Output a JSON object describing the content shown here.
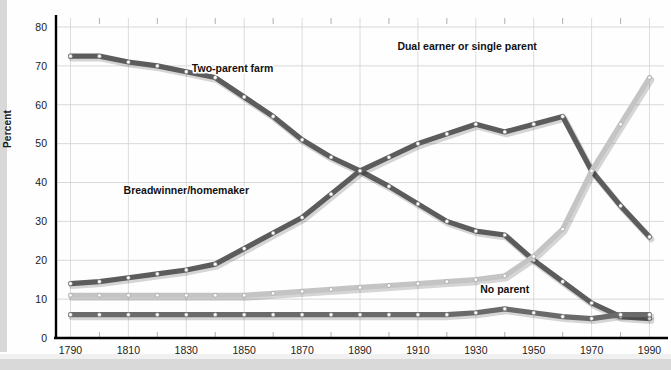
{
  "chart_data": {
    "type": "line",
    "title": "",
    "xlabel": "",
    "ylabel": "Percent",
    "xlim": [
      1785,
      1995
    ],
    "ylim": [
      0,
      80
    ],
    "grid": true,
    "legend_position": "inline-annotations",
    "x": [
      1790,
      1800,
      1810,
      1820,
      1830,
      1840,
      1850,
      1860,
      1870,
      1880,
      1890,
      1900,
      1910,
      1920,
      1930,
      1940,
      1950,
      1960,
      1970,
      1980,
      1990
    ],
    "xticks": [
      1790,
      1810,
      1830,
      1850,
      1870,
      1890,
      1910,
      1930,
      1950,
      1970,
      1990
    ],
    "yticks": [
      0,
      10,
      20,
      30,
      40,
      50,
      60,
      70,
      80
    ],
    "series": [
      {
        "name": "Two-parent farm",
        "color": "#5c5c5c",
        "label_x": 1846,
        "label_y": 68.5,
        "values": [
          72.5,
          72.5,
          71,
          70,
          68.5,
          67,
          62,
          57,
          51,
          46.5,
          43,
          39,
          34.5,
          30,
          27.5,
          26.5,
          20,
          14.5,
          9,
          5.5,
          5
        ]
      },
      {
        "name": "Breadwinner/homemaker",
        "color": "#5c5c5c",
        "label_x": 1830,
        "label_y": 37,
        "values": [
          14,
          14.5,
          15.5,
          16.5,
          17.5,
          19,
          23,
          27,
          31,
          37,
          43,
          46.5,
          50,
          52.5,
          55,
          53,
          55,
          57,
          43,
          34,
          26
        ]
      },
      {
        "name": "Dual earner or single parent",
        "color": "#c4c4c4",
        "label_x": 1927,
        "label_y": 74,
        "values": [
          11,
          11,
          11,
          11,
          11,
          11,
          11,
          11.5,
          12,
          12.5,
          13,
          13.5,
          14,
          14.5,
          15,
          16,
          21,
          28,
          43,
          55,
          67
        ]
      },
      {
        "name": "No parent",
        "color": "#6a6a6a",
        "label_x": 1940,
        "label_y": 11.5,
        "values": [
          6,
          6,
          6,
          6,
          6,
          6,
          6,
          6,
          6,
          6,
          6,
          6,
          6,
          6,
          6.5,
          7.5,
          6.5,
          5.5,
          5,
          6,
          6
        ]
      }
    ]
  },
  "axis": {
    "y_axis_title": "Percent",
    "y_tick_labels": [
      "0",
      "10",
      "20",
      "30",
      "40",
      "50",
      "60",
      "70",
      "80"
    ],
    "x_tick_labels": [
      "1790",
      "1810",
      "1830",
      "1850",
      "1870",
      "1890",
      "1910",
      "1930",
      "1950",
      "1970",
      "1990"
    ]
  },
  "annotations": [
    {
      "text": "Two-parent farm",
      "name": "label-two-parent-farm"
    },
    {
      "text": "Breadwinner/homemaker",
      "name": "label-breadwinner-homemaker"
    },
    {
      "text": "Dual earner or single parent",
      "name": "label-dual-earner"
    },
    {
      "text": "No parent",
      "name": "label-no-parent"
    }
  ],
  "colors": {
    "dark_series": "#5c5c5c",
    "light_series": "#c4c4c4",
    "grid": "#cfcfcf",
    "axis": "#000000",
    "marker_fill": "#ffffff",
    "background": "#fefefe"
  }
}
